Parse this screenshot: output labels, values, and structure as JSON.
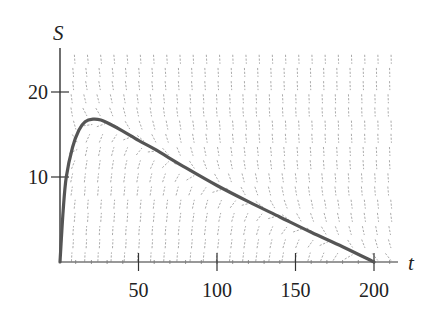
{
  "chart_data": {
    "type": "line",
    "title": "",
    "xlabel": "t",
    "ylabel": "S",
    "xlim": [
      0,
      210
    ],
    "ylim": [
      0,
      25
    ],
    "x_ticks": [
      50,
      100,
      150,
      200
    ],
    "x_tick_labels": [
      "50",
      "100",
      "150",
      "200"
    ],
    "y_ticks": [
      10,
      20
    ],
    "y_tick_labels": [
      "10",
      "20"
    ],
    "grid": false,
    "legend": null,
    "annotations": [
      "direction field (slope field) shown as short gray dashes"
    ],
    "series": [
      {
        "name": "solution curve",
        "x": [
          0,
          2,
          4,
          8,
          12,
          16,
          21,
          26,
          32,
          40,
          50,
          60,
          80,
          100,
          120,
          140,
          160,
          180,
          200
        ],
        "y": [
          0,
          6,
          10,
          13.5,
          15.5,
          16.5,
          16.8,
          16.7,
          16.2,
          15.4,
          14.3,
          13.3,
          11.1,
          9.0,
          7.1,
          5.3,
          3.5,
          1.8,
          0
        ]
      }
    ],
    "colors": {
      "curve": "#555555",
      "field": "#9a9a9a",
      "axis": "#333333"
    }
  }
}
